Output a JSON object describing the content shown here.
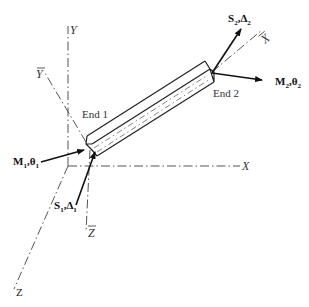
{
  "figure": {
    "type": "beam-element-coordinate-diagram",
    "global_axes": {
      "x_label": "X",
      "y_label": "Y",
      "z_label": "Z"
    },
    "local_axes": {
      "x_label": "X",
      "y_label": "Y",
      "z_label": "Z",
      "overbar": true
    },
    "ends": [
      {
        "label": "End 1",
        "force_symbol": "S",
        "force_sub": "1",
        "disp_symbol": "Δ",
        "disp_sub": "1",
        "moment_symbol": "M",
        "moment_sub": "1",
        "rot_symbol": "θ",
        "rot_sub": "1"
      },
      {
        "label": "End 2",
        "force_symbol": "S",
        "force_sub": "2",
        "disp_symbol": "Δ",
        "disp_sub": "2",
        "moment_symbol": "M",
        "moment_sub": "2",
        "rot_symbol": "θ",
        "rot_sub": "2"
      }
    ],
    "separator": ","
  }
}
